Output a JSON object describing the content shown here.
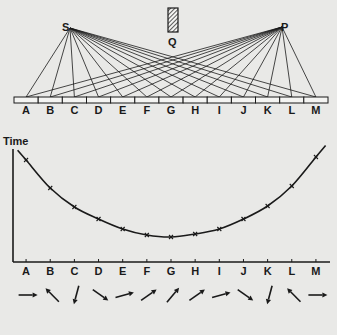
{
  "figure": {
    "source_label": "S",
    "detector_label": "P",
    "screen_label": "Q",
    "mirror_segments": [
      "A",
      "B",
      "C",
      "D",
      "E",
      "F",
      "G",
      "H",
      "I",
      "J",
      "K",
      "L",
      "M"
    ]
  },
  "chart_data": {
    "type": "line",
    "title": "",
    "ylabel": "Time",
    "xlabel": "",
    "categories": [
      "A",
      "B",
      "C",
      "D",
      "E",
      "F",
      "G",
      "H",
      "I",
      "J",
      "K",
      "L",
      "M"
    ],
    "values": [
      77,
      49,
      30,
      18,
      8,
      2,
      0,
      3,
      8,
      18,
      31,
      51,
      80
    ],
    "value_note": "relative time (arbitrary units, estimated from curve height above minimum at G)",
    "markers": "x",
    "grid": false,
    "y_ticks": false
  },
  "arrows": {
    "labels": [
      "A",
      "B",
      "C",
      "D",
      "E",
      "F",
      "G",
      "H",
      "I",
      "J",
      "K",
      "L",
      "M"
    ],
    "angles_deg": [
      0,
      135,
      255,
      325,
      15,
      35,
      50,
      35,
      15,
      325,
      255,
      135,
      0
    ],
    "angle_note": "direction of each arrow, degrees counter-clockwise from pointing right"
  },
  "colors": {
    "ink": "#1a1a1a",
    "paper": "#e9e9e7"
  }
}
